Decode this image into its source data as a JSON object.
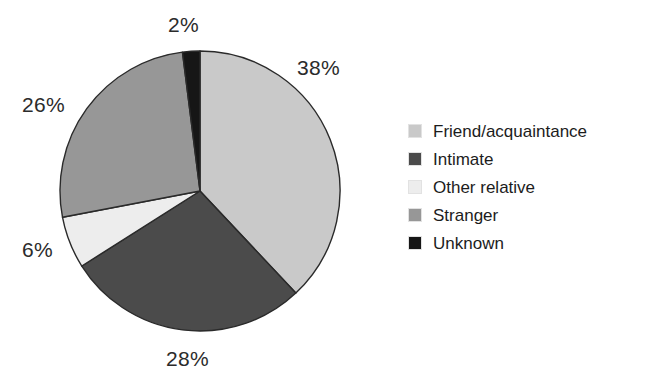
{
  "chart_data": {
    "type": "pie",
    "title": "",
    "subtitle": "",
    "xlabel": "",
    "ylabel": "",
    "legend_position": "right",
    "grid": false,
    "start_angle_deg": 0,
    "direction": "clockwise",
    "units": "percent",
    "categories": [
      "Friend/acquaintance",
      "Intimate",
      "Other relative",
      "Stranger",
      "Unknown"
    ],
    "values": [
      38,
      28,
      6,
      26,
      2
    ],
    "labels": [
      "38%",
      "28%",
      "6%",
      "26%",
      "2%"
    ],
    "colors": [
      "#c9c9c9",
      "#4b4b4b",
      "#ededed",
      "#979797",
      "#161616"
    ],
    "slices": [
      {
        "name": "Friend/acquaintance",
        "value": 38,
        "label": "38%",
        "color": "#c9c9c9"
      },
      {
        "name": "Intimate",
        "value": 28,
        "label": "28%",
        "color": "#4b4b4b"
      },
      {
        "name": "Other relative",
        "value": 6,
        "label": "6%",
        "color": "#ededed"
      },
      {
        "name": "Stranger",
        "value": 26,
        "label": "26%",
        "color": "#979797"
      },
      {
        "name": "Unknown",
        "value": 2,
        "label": "2%",
        "color": "#161616"
      }
    ]
  },
  "pie": {
    "center_x": 200,
    "center_y": 191,
    "radius": 140,
    "stroke_color": "#2a2a2a",
    "labels": {
      "friend": "38%",
      "intimate": "28%",
      "other": "6%",
      "stranger": "26%",
      "unknown": "2%"
    }
  },
  "legend": {
    "items": [
      {
        "label": "Friend/acquaintance",
        "color": "#c9c9c9"
      },
      {
        "label": "Intimate",
        "color": "#4b4b4b"
      },
      {
        "label": "Other relative",
        "color": "#ededed"
      },
      {
        "label": "Stranger",
        "color": "#979797"
      },
      {
        "label": "Unknown",
        "color": "#161616"
      }
    ]
  },
  "background_color": "#ffffff"
}
